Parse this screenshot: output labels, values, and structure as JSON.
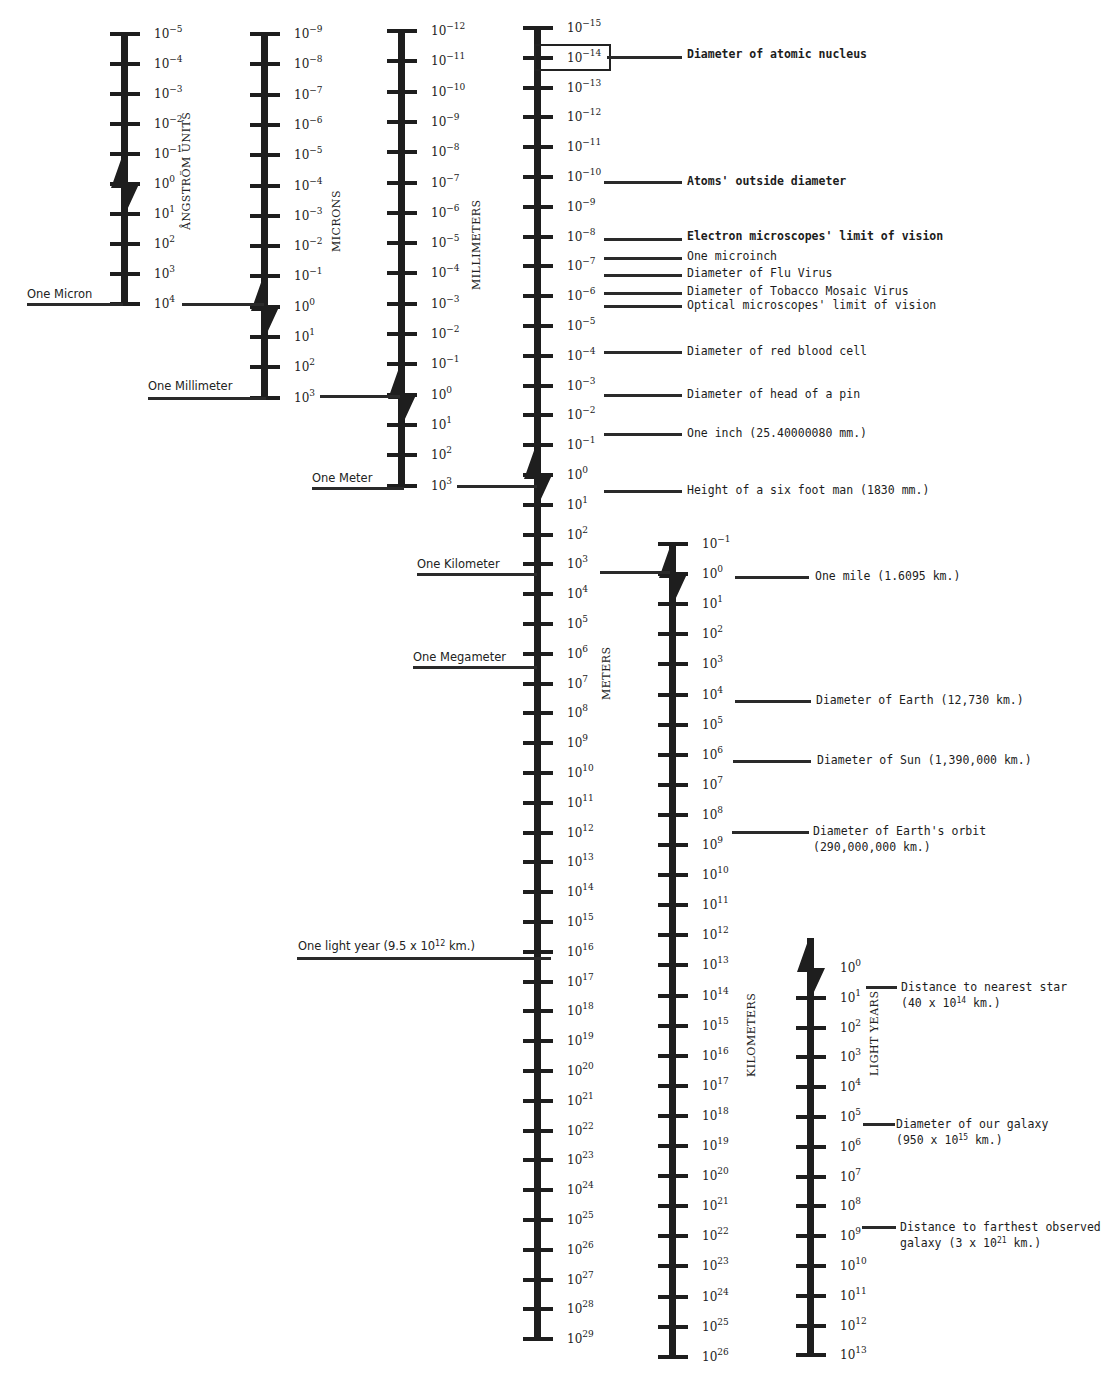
{
  "chart_data": {
    "type": "diagram",
    "scales": [
      {
        "id": "angstrom",
        "axis_label": "ÅNGSTRÖM UNITS",
        "ticks": [
          "-5",
          "-4",
          "-3",
          "-2",
          "-1",
          "0",
          "1",
          "2",
          "3",
          "4"
        ]
      },
      {
        "id": "microns",
        "axis_label": "MICRONS",
        "ticks": [
          "-9",
          "-8",
          "-7",
          "-6",
          "-5",
          "-4",
          "-3",
          "-2",
          "-1",
          "0",
          "1",
          "2",
          "3"
        ]
      },
      {
        "id": "millimeters",
        "axis_label": "MILLIMETERS",
        "ticks": [
          "-12",
          "-11",
          "-10",
          "-9",
          "-8",
          "-7",
          "-6",
          "-5",
          "-4",
          "-3",
          "-2",
          "-1",
          "0",
          "1",
          "2",
          "3"
        ]
      },
      {
        "id": "meters",
        "axis_label": "METERS",
        "ticks": [
          "-15",
          "-14",
          "-13",
          "-12",
          "-11",
          "-10",
          "-9",
          "-8",
          "-7",
          "-6",
          "-5",
          "-4",
          "-3",
          "-2",
          "-1",
          "0",
          "1",
          "2",
          "3",
          "4",
          "5",
          "6",
          "7",
          "8",
          "9",
          "10",
          "11",
          "12",
          "13",
          "14",
          "15",
          "16",
          "17",
          "18",
          "19",
          "20",
          "21",
          "22",
          "23",
          "24",
          "25",
          "26",
          "27",
          "28",
          "29"
        ]
      },
      {
        "id": "kilometers",
        "axis_label": "KILOMETERS",
        "ticks": [
          "-1",
          "0",
          "1",
          "2",
          "3",
          "4",
          "5",
          "6",
          "7",
          "8",
          "9",
          "10",
          "11",
          "12",
          "13",
          "14",
          "15",
          "16",
          "17",
          "18",
          "19",
          "20",
          "21",
          "22",
          "23",
          "24",
          "25",
          "26"
        ]
      },
      {
        "id": "light_years",
        "axis_label": "LIGHT YEARS",
        "ticks": [
          "0",
          "1",
          "2",
          "3",
          "4",
          "5",
          "6",
          "7",
          "8",
          "9",
          "10",
          "11",
          "12",
          "13"
        ]
      }
    ],
    "unit_links": [
      {
        "label": "One Micron",
        "from": "angstrom 10^4",
        "to": "microns 10^0"
      },
      {
        "label": "One Millimeter",
        "from": "microns 10^3",
        "to": "millimeters 10^0"
      },
      {
        "label": "One Meter",
        "from": "millimeters 10^3",
        "to": "meters 10^0"
      },
      {
        "label": "One Kilometer",
        "from": "meters 10^3",
        "to": "kilometers 10^0"
      },
      {
        "label": "One Megameter",
        "from": "meters 10^6",
        "to": null
      },
      {
        "label": "One light year (9.5 x 10^12 km.)",
        "from": "meters 10^16",
        "to": null
      }
    ],
    "annotations": [
      {
        "scale": "meters",
        "at": "10^-14",
        "text": "Diameter of atomic nucleus"
      },
      {
        "scale": "meters",
        "at": "10^-10",
        "text": "Atoms' outside diameter"
      },
      {
        "scale": "meters",
        "at": "10^-8",
        "text": "Electron microscopes' limit of vision"
      },
      {
        "scale": "meters",
        "at": "~2.5x10^-8",
        "text": "One microinch"
      },
      {
        "scale": "meters",
        "at": "~10^-7",
        "text": "Diameter of Flu Virus"
      },
      {
        "scale": "meters",
        "at": "~3x10^-7",
        "text": "Diameter of Tobacco Mosaic Virus"
      },
      {
        "scale": "meters",
        "at": "~10^-6",
        "text": "Optical microscopes' limit of vision"
      },
      {
        "scale": "meters",
        "at": "10^-4",
        "text": "Diameter of red blood cell"
      },
      {
        "scale": "meters",
        "at": "10^-3",
        "text": "Diameter of head of a pin"
      },
      {
        "scale": "meters",
        "at": "~2.5x10^-2",
        "text": "One inch (25.40000080 mm.)"
      },
      {
        "scale": "meters",
        "at": "~1.8x10^0",
        "text": "Height of a six foot man (1830 mm.)"
      },
      {
        "scale": "kilometers",
        "at": "~1.6x10^0",
        "text": "One mile (1.6095 km.)"
      },
      {
        "scale": "kilometers",
        "at": "~10^4",
        "text": "Diameter of Earth (12,730 km.)"
      },
      {
        "scale": "kilometers",
        "at": "~10^6",
        "text": "Diameter of Sun (1,390,000 km.)"
      },
      {
        "scale": "kilometers",
        "at": "~3x10^8",
        "text": "Diameter of Earth's orbit (290,000,000 km.)"
      },
      {
        "scale": "light_years",
        "at": "~4x10^0",
        "text": "Distance to nearest star (40 x 10^14 km.)"
      },
      {
        "scale": "light_years",
        "at": "~10^5",
        "text": "Diameter of our galaxy (950 x 10^15 km.)"
      },
      {
        "scale": "light_years",
        "at": "~3x10^8",
        "text": "Distance to farthest observed galaxy (3 x 10^21 km.)"
      }
    ]
  },
  "axis_titles": {
    "angstrom": "ÅNGSTRÖM UNITS",
    "microns": "MICRONS",
    "millimeters": "MILLIMETERS",
    "meters": "METERS",
    "kilometers": "KILOMETERS",
    "light_years": "LIGHT YEARS"
  },
  "left_labels": {
    "one_micron": "One Micron",
    "one_millimeter": "One Millimeter",
    "one_meter": "One Meter",
    "one_kilometer": "One Kilometer",
    "one_megameter": "One Megameter",
    "one_light_year_pre": "One light year (9.5 x 10",
    "one_light_year_exp": "12",
    "one_light_year_post": " km.)"
  },
  "annotations": {
    "nucleus": "Diameter of atomic nucleus",
    "atoms": "Atoms' outside diameter",
    "electron": "Electron microscopes' limit of vision",
    "microinch": "One microinch",
    "flu": "Diameter of Flu Virus",
    "tobacco": "Diameter of Tobacco Mosaic Virus",
    "optical": "Optical microscopes' limit of vision",
    "rbc": "Diameter of red blood cell",
    "pin": "Diameter of head of a pin",
    "inch": "One inch (25.40000080 mm.)",
    "man": "Height of a six foot man (1830 mm.)",
    "mile": "One mile (1.6095 km.)",
    "earth": "Diameter of Earth (12,730 km.)",
    "sun": "Diameter of Sun (1,390,000 km.)",
    "orbit_1": "Diameter of Earth's orbit",
    "orbit_2": "(290,000,000 km.)",
    "star_1": "Distance to nearest star",
    "star_2_pre": "(40 x 10",
    "star_2_exp": "14",
    "star_2_post": " km.)",
    "galaxy_1": "Diameter of our galaxy",
    "galaxy_2_pre": "(950 x 10",
    "galaxy_2_exp": "15",
    "galaxy_2_post": " km.)",
    "far_1": "Distance to farthest observed",
    "far_2_pre": "galaxy (3 x 10",
    "far_2_exp": "21",
    "far_2_post": " km.)"
  }
}
